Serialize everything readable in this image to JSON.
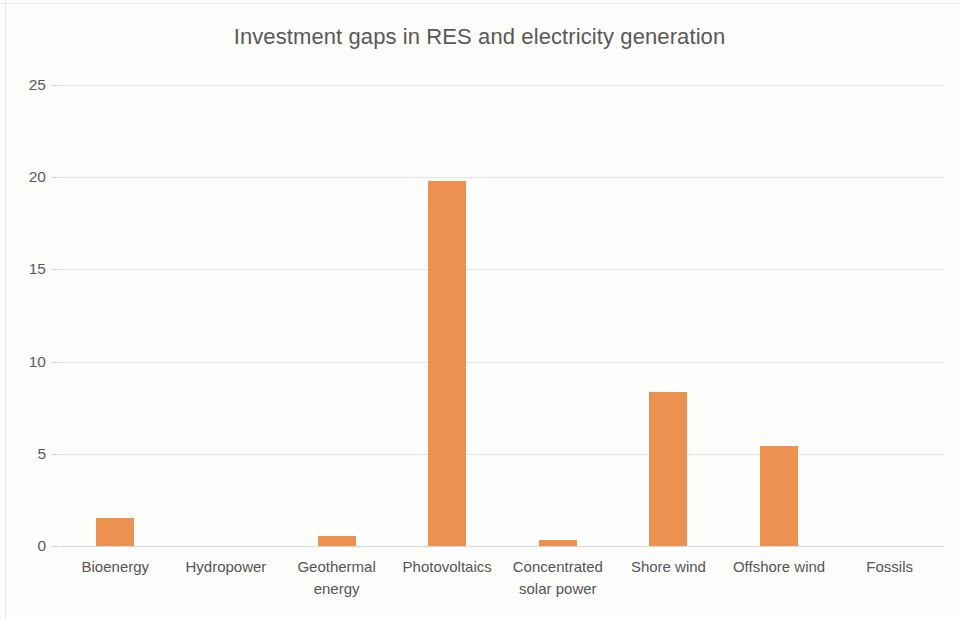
{
  "chart_data": {
    "type": "bar",
    "title": "Investment gaps in RES and electricity generation",
    "xlabel": "",
    "ylabel": "",
    "ylim": [
      0,
      25
    ],
    "yticks": [
      "0",
      "5",
      "10",
      "15",
      "20",
      "25"
    ],
    "ytick_values": [
      0,
      5,
      10,
      15,
      20,
      25
    ],
    "grid": true,
    "legend": "none",
    "bar_color": "#ed9150",
    "title_color": "#585858",
    "grid_color": "#e4e4e4",
    "categories": [
      "Bioenergy",
      "Hydropower",
      "Geothermal energy",
      "Photovoltaics",
      "Concentrated solar power",
      "Shore wind",
      "Offshore wind",
      "Fossils"
    ],
    "category_lines": [
      [
        "Bioenergy"
      ],
      [
        "Hydropower"
      ],
      [
        "Geothermal",
        "energy"
      ],
      [
        "Photovoltaics"
      ],
      [
        "Concentrated",
        "solar power"
      ],
      [
        "Shore wind"
      ],
      [
        "Offshore wind"
      ],
      [
        "Fossils"
      ]
    ],
    "values": [
      1.5,
      0,
      0.55,
      19.8,
      0.3,
      8.35,
      5.45,
      0
    ]
  }
}
